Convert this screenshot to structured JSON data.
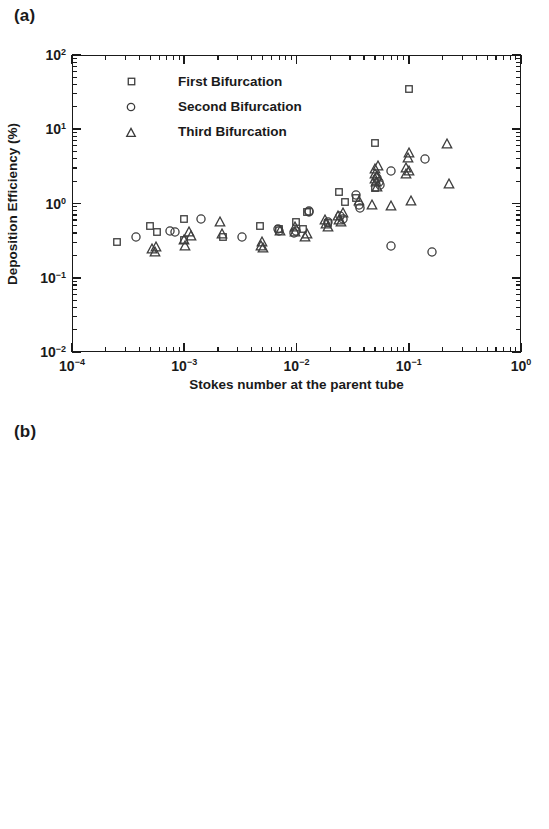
{
  "figure": {
    "panel_a_label": "(a)",
    "panel_b_label": "(b)"
  },
  "legend": {
    "items": [
      {
        "symbol": "square",
        "label": "First Bifurcation"
      },
      {
        "symbol": "circle",
        "label": "Second Bifurcation"
      },
      {
        "symbol": "triangle",
        "label": "Third Bifurcation"
      }
    ]
  },
  "axis_text": {
    "x_title": "Stokes number at the parent tube",
    "x_ticks": [
      "10-4",
      "10-3",
      "10-2",
      "10-1",
      "100"
    ],
    "y_ticks": [
      "10-2",
      "10-1",
      "100",
      "101",
      "102"
    ],
    "y_title_a": "Deposition Efficiency (%)",
    "y_title_b": "Deposition Fraction (%)"
  },
  "colors": {
    "axis": "#1a1a1a",
    "marker": "#3c3c3c",
    "background": "#ffffff"
  },
  "chart_data": [
    {
      "id": "panel-a",
      "type": "scatter",
      "title": "(a)",
      "xlabel": "Stokes number at the parent tube",
      "ylabel": "Deposition Efficiency (%)",
      "xscale": "log",
      "yscale": "log",
      "xlim": [
        0.0001,
        1
      ],
      "ylim": [
        0.01,
        100
      ],
      "xticks": [
        0.0001,
        0.001,
        0.01,
        0.1,
        1
      ],
      "yticks": [
        0.01,
        0.1,
        1,
        10,
        100
      ],
      "grid": false,
      "legend_position": "upper left",
      "series": [
        {
          "name": "First Bifurcation",
          "marker": "square",
          "points": [
            [
              0.00025,
              0.3
            ],
            [
              0.0005,
              0.5
            ],
            [
              0.00057,
              0.41
            ],
            [
              0.001,
              0.62
            ],
            [
              0.001,
              0.32
            ],
            [
              0.0022,
              0.35
            ],
            [
              0.0047,
              0.5
            ],
            [
              0.007,
              0.45
            ],
            [
              0.0098,
              0.57
            ],
            [
              0.0115,
              0.46
            ],
            [
              0.0125,
              0.78
            ],
            [
              0.019,
              0.55
            ],
            [
              0.024,
              1.45
            ],
            [
              0.027,
              1.05
            ],
            [
              0.034,
              1.2
            ],
            [
              0.05,
              6.5
            ],
            [
              0.05,
              1.6
            ],
            [
              0.1,
              35.0
            ]
          ]
        },
        {
          "name": "Second Bifurcation",
          "marker": "circle",
          "points": [
            [
              0.00037,
              0.35
            ],
            [
              0.00075,
              0.43
            ],
            [
              0.00082,
              0.41
            ],
            [
              0.0014,
              0.62
            ],
            [
              0.0033,
              0.35
            ],
            [
              0.0069,
              0.46
            ],
            [
              0.007,
              0.42
            ],
            [
              0.0095,
              0.4
            ],
            [
              0.0098,
              0.42
            ],
            [
              0.0128,
              0.8
            ],
            [
              0.013,
              0.78
            ],
            [
              0.019,
              0.56
            ],
            [
              0.0245,
              0.68
            ],
            [
              0.026,
              0.62
            ],
            [
              0.034,
              1.3
            ],
            [
              0.036,
              0.95
            ],
            [
              0.037,
              0.88
            ],
            [
              0.052,
              2.2
            ],
            [
              0.054,
              1.95
            ],
            [
              0.055,
              1.75
            ],
            [
              0.07,
              2.7
            ],
            [
              0.07,
              0.27
            ],
            [
              0.14,
              4.0
            ],
            [
              0.16,
              0.22
            ]
          ]
        },
        {
          "name": "Third Bifurcation",
          "marker": "triangle",
          "points": [
            [
              0.00052,
              0.25
            ],
            [
              0.00055,
              0.23
            ],
            [
              0.00056,
              0.27
            ],
            [
              0.001,
              0.33
            ],
            [
              0.00102,
              0.28
            ],
            [
              0.0011,
              0.42
            ],
            [
              0.00115,
              0.38
            ],
            [
              0.0021,
              0.58
            ],
            [
              0.00215,
              0.4
            ],
            [
              0.0048,
              0.28
            ],
            [
              0.0049,
              0.31
            ],
            [
              0.005,
              0.26
            ],
            [
              0.0072,
              0.44
            ],
            [
              0.0096,
              0.5
            ],
            [
              0.0097,
              0.42
            ],
            [
              0.012,
              0.36
            ],
            [
              0.0125,
              0.4
            ],
            [
              0.018,
              0.62
            ],
            [
              0.0185,
              0.55
            ],
            [
              0.019,
              0.5
            ],
            [
              0.0235,
              0.7
            ],
            [
              0.024,
              0.62
            ],
            [
              0.025,
              0.58
            ],
            [
              0.026,
              0.78
            ],
            [
              0.036,
              1.1
            ],
            [
              0.047,
              1.0
            ],
            [
              0.05,
              2.2
            ],
            [
              0.05,
              2.6
            ],
            [
              0.05,
              3.0
            ],
            [
              0.051,
              2.0
            ],
            [
              0.052,
              1.7
            ],
            [
              0.052,
              2.4
            ],
            [
              0.053,
              3.3
            ],
            [
              0.07,
              0.95
            ],
            [
              0.095,
              2.6
            ],
            [
              0.095,
              3.1
            ],
            [
              0.098,
              4.2
            ],
            [
              0.1,
              5.0
            ],
            [
              0.1,
              2.8
            ],
            [
              0.105,
              1.1
            ],
            [
              0.22,
              6.5
            ],
            [
              0.23,
              1.9
            ]
          ]
        }
      ]
    },
    {
      "id": "panel-b",
      "type": "scatter",
      "title": "(b)",
      "xlabel": "Stokes number at the parent tube",
      "ylabel": "Deposition Fraction (%)",
      "xscale": "log",
      "yscale": "log",
      "xlim": [
        0.0001,
        1
      ],
      "ylim": [
        0.01,
        100
      ],
      "xticks": [
        0.0001,
        0.001,
        0.01,
        0.1,
        1
      ],
      "yticks": [
        0.01,
        0.1,
        1,
        10,
        100
      ],
      "grid": false,
      "legend_position": "upper left",
      "series": [
        {
          "name": "First Bifurcation",
          "marker": "square",
          "points": [
            [
              0.00025,
              0.27
            ],
            [
              0.00052,
              0.47
            ],
            [
              0.001,
              0.6
            ],
            [
              0.0021,
              0.32
            ],
            [
              0.0047,
              0.5
            ],
            [
              0.0068,
              0.37
            ],
            [
              0.0095,
              0.6
            ],
            [
              0.012,
              0.75
            ],
            [
              0.0125,
              0.45
            ],
            [
              0.024,
              1.2
            ],
            [
              0.0245,
              0.9
            ],
            [
              0.025,
              0.6
            ],
            [
              0.05,
              3.3
            ],
            [
              0.05,
              3.1
            ],
            [
              0.095,
              4.5
            ]
          ]
        },
        {
          "name": "Second Bifurcation",
          "marker": "circle",
          "points": [
            [
              0.00037,
              0.16
            ],
            [
              0.00038,
              0.12
            ],
            [
              0.00078,
              0.19
            ],
            [
              0.0008,
              0.18
            ],
            [
              0.0014,
              0.28
            ],
            [
              0.0033,
              0.2
            ],
            [
              0.0034,
              0.14
            ],
            [
              0.0068,
              0.22
            ],
            [
              0.0069,
              0.2
            ],
            [
              0.0095,
              0.22
            ],
            [
              0.0096,
              0.15
            ],
            [
              0.0125,
              0.35
            ],
            [
              0.0185,
              0.25
            ],
            [
              0.019,
              0.23
            ],
            [
              0.035,
              0.52
            ],
            [
              0.036,
              0.48
            ],
            [
              0.037,
              0.38
            ],
            [
              0.052,
              0.5
            ],
            [
              0.053,
              0.52
            ],
            [
              0.07,
              0.52
            ],
            [
              0.072,
              0.36
            ],
            [
              0.07,
              0.042
            ],
            [
              0.14,
              0.19
            ]
          ]
        },
        {
          "name": "Third Bifurcation",
          "marker": "triangle",
          "points": [
            [
              0.00052,
              0.05
            ],
            [
              0.00054,
              0.048
            ],
            [
              0.00056,
              0.055
            ],
            [
              0.00058,
              0.045
            ],
            [
              0.001,
              0.1
            ],
            [
              0.00102,
              0.11
            ],
            [
              0.00105,
              0.056
            ],
            [
              0.002,
              0.15
            ],
            [
              0.0021,
              0.082
            ],
            [
              0.0047,
              0.075
            ],
            [
              0.0048,
              0.07
            ],
            [
              0.0049,
              0.063
            ],
            [
              0.0094,
              0.086
            ],
            [
              0.0095,
              0.08
            ],
            [
              0.0096,
              0.15
            ],
            [
              0.0115,
              0.11
            ],
            [
              0.012,
              0.062
            ],
            [
              0.015,
              0.12
            ],
            [
              0.0155,
              0.11
            ],
            [
              0.018,
              0.22
            ],
            [
              0.0185,
              0.2
            ],
            [
              0.019,
              0.14
            ],
            [
              0.0195,
              0.15
            ],
            [
              0.024,
              0.22
            ],
            [
              0.0245,
              0.3
            ],
            [
              0.025,
              0.1
            ],
            [
              0.034,
              0.21
            ],
            [
              0.035,
              0.19
            ],
            [
              0.036,
              0.35
            ],
            [
              0.05,
              0.85
            ],
            [
              0.051,
              0.72
            ],
            [
              0.052,
              0.52
            ],
            [
              0.053,
              0.38
            ],
            [
              0.054,
              0.2
            ],
            [
              0.09,
              0.8
            ],
            [
              0.095,
              0.7
            ],
            [
              0.098,
              0.58
            ],
            [
              0.1,
              0.55
            ],
            [
              0.1,
              0.015
            ],
            [
              0.14,
              0.19
            ],
            [
              0.21,
              0.15
            ],
            [
              0.22,
              0.092
            ]
          ]
        }
      ]
    }
  ]
}
